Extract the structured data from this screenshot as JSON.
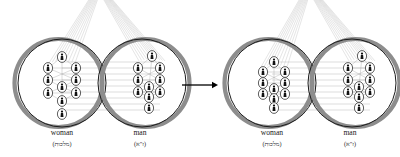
{
  "figure": {
    "title": "",
    "type": "kabbalah-partzuf-diagram",
    "background_color": "#ffffff",
    "width": 400,
    "height": 157
  },
  "colors": {
    "sphere_outline": "#1a1a1a",
    "sphere_shadow": "#8d8d8d",
    "node_outline": "#1a1a1a",
    "node_fill": "#ffffff",
    "connector_line": "#b8b8b8",
    "beam_line": "#bdbdbd",
    "arrow": "#000000",
    "text": "#1a1a1a"
  },
  "arrow": {
    "name": "transition-arrow",
    "glyph": "→",
    "direction": "right",
    "x1": 182,
    "x2": 218,
    "y": 85
  },
  "groups": [
    {
      "id": "before",
      "name": "state-before",
      "spheres": [
        {
          "id": "woman-before",
          "name": "woman-sphere",
          "label_en": "woman",
          "label_he": "(מלכות)",
          "cx": 62,
          "cy": 83,
          "r": 44,
          "shadow_side": "left",
          "label_x": 62,
          "label_en_y": 135,
          "label_he_y": 146,
          "tree": {
            "name": "sefirot-tree",
            "spread": "wide",
            "node_rx": 4.6,
            "node_ry": 5.4,
            "nodes": [
              {
                "id": "keter",
                "x": 62,
                "y": 57
              },
              {
                "id": "chokhmah",
                "x": 48,
                "y": 68
              },
              {
                "id": "binah",
                "x": 76,
                "y": 68
              },
              {
                "id": "chesed",
                "x": 48,
                "y": 80
              },
              {
                "id": "gevurah",
                "x": 76,
                "y": 80
              },
              {
                "id": "tiferet",
                "x": 62,
                "y": 87
              },
              {
                "id": "netzach",
                "x": 48,
                "y": 93
              },
              {
                "id": "hod",
                "x": 76,
                "y": 93
              },
              {
                "id": "yesod",
                "x": 62,
                "y": 101
              },
              {
                "id": "malkhut",
                "x": 62,
                "y": 114
              }
            ]
          }
        },
        {
          "id": "man-before",
          "name": "man-sphere",
          "label_en": "man",
          "label_he": "(ז\"א)",
          "cx": 142,
          "cy": 83,
          "r": 44,
          "shadow_side": "right",
          "label_x": 140,
          "label_en_y": 135,
          "label_he_y": 146,
          "tree": {
            "name": "sefirot-tree",
            "spread": "compact",
            "node_rx": 4.6,
            "node_ry": 5.4,
            "nodes": [
              {
                "id": "keter",
                "x": 152,
                "y": 56
              },
              {
                "id": "chokhmah",
                "x": 138,
                "y": 68
              },
              {
                "id": "binah",
                "x": 160,
                "y": 68
              },
              {
                "id": "chesed",
                "x": 138,
                "y": 80
              },
              {
                "id": "gevurah",
                "x": 160,
                "y": 80
              },
              {
                "id": "tiferet",
                "x": 149,
                "y": 87
              },
              {
                "id": "netzach",
                "x": 138,
                "y": 92
              },
              {
                "id": "hod",
                "x": 160,
                "y": 92
              },
              {
                "id": "yesod",
                "x": 149,
                "y": 97
              },
              {
                "id": "malkhut",
                "x": 149,
                "y": 108
              }
            ]
          }
        }
      ],
      "connectors": {
        "name": "inter-sphere-connectors",
        "count": 9,
        "x_start": 62,
        "x_end": 160,
        "y_start": 62,
        "y_end": 110
      },
      "beams": [
        {
          "name": "beam-bundle-left",
          "apex_x": 96,
          "apex_y": -6,
          "target_x": 62,
          "target_y": 60,
          "strands": 9
        },
        {
          "name": "beam-bundle-right",
          "apex_x": 104,
          "apex_y": -6,
          "target_x": 152,
          "target_y": 58,
          "strands": 11
        }
      ]
    },
    {
      "id": "after",
      "name": "state-after",
      "spheres": [
        {
          "id": "woman-after",
          "name": "woman-sphere",
          "label_en": "woman",
          "label_he": "(מלכות)",
          "cx": 272,
          "cy": 83,
          "r": 44,
          "shadow_side": "left",
          "label_x": 272,
          "label_en_y": 135,
          "label_he_y": 146,
          "tree": {
            "name": "sefirot-tree",
            "spread": "compact",
            "node_rx": 4.6,
            "node_ry": 5.4,
            "nodes": [
              {
                "id": "keter",
                "x": 274,
                "y": 62
              },
              {
                "id": "chokhmah",
                "x": 263,
                "y": 72
              },
              {
                "id": "binah",
                "x": 285,
                "y": 72
              },
              {
                "id": "chesed",
                "x": 263,
                "y": 83
              },
              {
                "id": "gevurah",
                "x": 285,
                "y": 83
              },
              {
                "id": "tiferet",
                "x": 274,
                "y": 89
              },
              {
                "id": "netzach",
                "x": 263,
                "y": 94
              },
              {
                "id": "hod",
                "x": 285,
                "y": 94
              },
              {
                "id": "yesod",
                "x": 274,
                "y": 99
              },
              {
                "id": "malkhut",
                "x": 274,
                "y": 108
              }
            ]
          }
        },
        {
          "id": "man-after",
          "name": "man-sphere",
          "label_en": "man",
          "label_he": "(ז\"א)",
          "cx": 352,
          "cy": 83,
          "r": 44,
          "shadow_side": "right",
          "label_x": 350,
          "label_en_y": 135,
          "label_he_y": 146,
          "tree": {
            "name": "sefirot-tree",
            "spread": "compact",
            "node_rx": 4.6,
            "node_ry": 5.4,
            "nodes": [
              {
                "id": "keter",
                "x": 362,
                "y": 56
              },
              {
                "id": "chokhmah",
                "x": 348,
                "y": 68
              },
              {
                "id": "binah",
                "x": 370,
                "y": 68
              },
              {
                "id": "chesed",
                "x": 348,
                "y": 80
              },
              {
                "id": "gevurah",
                "x": 370,
                "y": 80
              },
              {
                "id": "tiferet",
                "x": 359,
                "y": 87
              },
              {
                "id": "netzach",
                "x": 348,
                "y": 92
              },
              {
                "id": "hod",
                "x": 370,
                "y": 92
              },
              {
                "id": "yesod",
                "x": 359,
                "y": 97
              },
              {
                "id": "malkhut",
                "x": 359,
                "y": 108
              }
            ]
          }
        }
      ],
      "connectors": {
        "name": "inter-sphere-connectors",
        "count": 9,
        "x_start": 272,
        "x_end": 370,
        "y_start": 62,
        "y_end": 110
      },
      "beams": [
        {
          "name": "beam-bundle-left",
          "apex_x": 306,
          "apex_y": -6,
          "target_x": 274,
          "target_y": 64,
          "strands": 9
        },
        {
          "name": "beam-bundle-right",
          "apex_x": 314,
          "apex_y": -6,
          "target_x": 362,
          "target_y": 58,
          "strands": 11
        }
      ]
    }
  ]
}
